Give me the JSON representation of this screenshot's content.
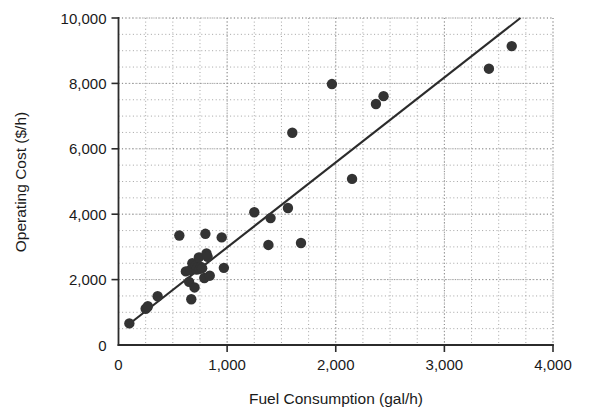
{
  "chart_data": {
    "type": "scatter",
    "title": "",
    "xlabel": "Fuel Consumption (gal/h)",
    "ylabel": "Operating Cost ($/h)",
    "xlim": [
      0,
      4000
    ],
    "ylim": [
      0,
      10000
    ],
    "xticks": [
      0,
      1000,
      2000,
      3000,
      4000
    ],
    "xtick_labels": [
      "0",
      "1,000",
      "2,000",
      "3,000",
      "4,000"
    ],
    "yticks": [
      0,
      2000,
      4000,
      6000,
      8000,
      10000
    ],
    "ytick_labels": [
      "0",
      "2,000",
      "4,000",
      "6,000",
      "8,000",
      "10,000"
    ],
    "grid": true,
    "grid_style": "dotted",
    "grid_minor_x_step": 250,
    "grid_minor_y_step": 500,
    "legend": null,
    "marker_color": "#333333",
    "marker_size": 5.2,
    "series": [
      {
        "name": "Aircraft",
        "points": [
          [
            100,
            660
          ],
          [
            250,
            1110
          ],
          [
            265,
            1150
          ],
          [
            270,
            1190
          ],
          [
            360,
            1490
          ],
          [
            560,
            3350
          ],
          [
            620,
            2250
          ],
          [
            650,
            1930
          ],
          [
            660,
            2290
          ],
          [
            670,
            1400
          ],
          [
            680,
            2500
          ],
          [
            700,
            1760
          ],
          [
            710,
            2430
          ],
          [
            720,
            2310
          ],
          [
            730,
            2380
          ],
          [
            740,
            2680
          ],
          [
            750,
            2330
          ],
          [
            760,
            2390
          ],
          [
            770,
            2350
          ],
          [
            790,
            2050
          ],
          [
            800,
            3400
          ],
          [
            810,
            2800
          ],
          [
            820,
            2700
          ],
          [
            840,
            2120
          ],
          [
            950,
            3290
          ],
          [
            970,
            2360
          ],
          [
            1250,
            4060
          ],
          [
            1380,
            3060
          ],
          [
            1400,
            3880
          ],
          [
            1560,
            4190
          ],
          [
            1600,
            6490
          ],
          [
            1680,
            3120
          ],
          [
            1965,
            7980
          ],
          [
            2150,
            5080
          ],
          [
            2370,
            7370
          ],
          [
            2440,
            7610
          ],
          [
            3410,
            8450
          ],
          [
            3620,
            9140
          ]
        ]
      }
    ],
    "fit_line": {
      "type": "linear-regression",
      "x_start": 90,
      "y_start": 620,
      "x_end": 3700,
      "y_end": 10000,
      "color": "#2b2b2b"
    }
  }
}
